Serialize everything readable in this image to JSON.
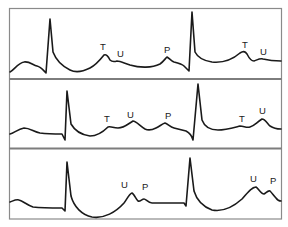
{
  "figure": {
    "colors": {
      "frame": "#8a8a8a",
      "divider": "#7d7d7d",
      "trace": "#1a1a1a",
      "background": "#ffffff"
    },
    "frame": {
      "x": 9.5,
      "y": 8.5,
      "width": 272,
      "height": 210.5
    },
    "dividers": [
      79,
      148.5
    ]
  },
  "panels": [
    {
      "name": "panel-1",
      "path": "M10,72 C14,70 18,63 24,62 C29,61 33,65 37,66 C41,67 43,70 46,73 L50,19 L53,52 C56,60 62,66 70,70 C76,73 82,72 90,68 C96,65 100,60 104,55 C106,54 108,56 110,60 C112,62 114,62 117,61 C120,61 124,63 130,65 C140,68 152,68 160,64 C163,62 165,59 167,57 C169,58 171,61 174,62 C178,63 182,64 184,66 C186,68 188,70 189,71 L192,12 L195,52 C198,58 205,61 212,62 C222,63 232,60 240,53 C243,51 245,51 247,54 C249,58 251,61 254,61 C257,60 260,58 263,59 C267,60 271,61 281,61",
      "labels": [
        {
          "text": "T",
          "x": 100,
          "y": 50
        },
        {
          "text": "U",
          "x": 117,
          "y": 57
        },
        {
          "text": "P",
          "x": 164,
          "y": 53
        },
        {
          "text": "T",
          "x": 242,
          "y": 48
        },
        {
          "text": "U",
          "x": 260,
          "y": 55
        }
      ]
    },
    {
      "name": "panel-2",
      "path": "M10,134 C14,133 18,129 24,128 C30,128 34,132 40,133 C48,134 56,134 62,134 L65,140 L67,91 L71,124 C75,131 82,135 90,136 C98,136 104,131 108,127 C111,126 113,128 118,128 C124,128 128,124 133,121 C136,121 140,126 145,129 C149,131 152,130 156,128 C160,126 162,124 165,123 C168,124 170,127 174,128 C178,129 182,130 186,131 C190,133 192,136 193,140 L198,84 L202,120 C205,128 212,130 218,130 C225,130 232,128 240,126 C244,126 246,128 250,127 C254,126 256,123 262,119 C265,119 267,123 270,126 C273,128 276,129 281,129",
      "labels": [
        {
          "text": "T",
          "x": 104,
          "y": 122
        },
        {
          "text": "U",
          "x": 127,
          "y": 118
        },
        {
          "text": "P",
          "x": 165,
          "y": 119
        },
        {
          "text": "T",
          "x": 239,
          "y": 122
        },
        {
          "text": "U",
          "x": 259,
          "y": 114
        }
      ]
    },
    {
      "name": "panel-3",
      "path": "M10,202 C13,201 16,199 19,200 C23,201 27,205 33,207 C42,208 52,208 62,208 L65,211 L67,162 L71,196 C74,207 82,215 92,217 C104,219 116,212 124,203 C127,199 129,194 132,193 C134,194 136,199 138,201 C140,202 142,199 144,199 C146,199 148,203 152,203 L184,203 L186,206 L190,158 L194,191 C197,201 204,207 212,210 C222,212 232,208 242,199 C248,192 252,187 256,187 C258,188 261,194 264,194 C266,193 268,190 270,191 C272,193 274,196 276,198 C278,201 280,201 281,201",
      "labels": [
        {
          "text": "U",
          "x": 121,
          "y": 188
        },
        {
          "text": "P",
          "x": 142,
          "y": 190
        },
        {
          "text": "U",
          "x": 250,
          "y": 182
        },
        {
          "text": "P",
          "x": 270,
          "y": 184
        }
      ]
    }
  ]
}
